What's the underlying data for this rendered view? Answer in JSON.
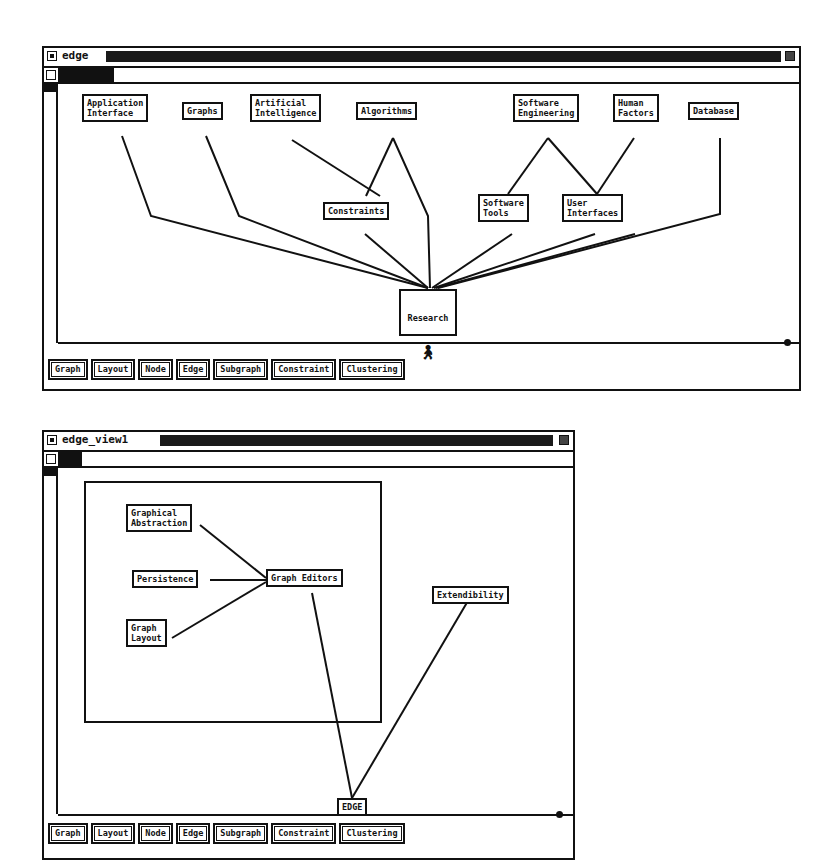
{
  "windows": [
    {
      "title": "edge",
      "nodes": [
        {
          "id": "app",
          "label": "Application\nInterface"
        },
        {
          "id": "graphs",
          "label": "Graphs"
        },
        {
          "id": "ai",
          "label": "Artificial\nIntelligence"
        },
        {
          "id": "algo",
          "label": "Algorithms"
        },
        {
          "id": "se",
          "label": "Software\nEngineering"
        },
        {
          "id": "hf",
          "label": "Human\nFactors"
        },
        {
          "id": "db",
          "label": "Database"
        },
        {
          "id": "constraints",
          "label": "Constraints"
        },
        {
          "id": "swtools",
          "label": "Software\nTools"
        },
        {
          "id": "ui",
          "label": "User\nInterfaces"
        },
        {
          "id": "research",
          "label": "Research",
          "icon": "person-icon"
        }
      ],
      "edges": [
        [
          "app",
          "research"
        ],
        [
          "graphs",
          "research"
        ],
        [
          "ai",
          "constraints"
        ],
        [
          "algo",
          "constraints"
        ],
        [
          "algo",
          "research"
        ],
        [
          "constraints",
          "research"
        ],
        [
          "se",
          "swtools"
        ],
        [
          "se",
          "ui"
        ],
        [
          "hf",
          "ui"
        ],
        [
          "swtools",
          "research"
        ],
        [
          "ui",
          "research"
        ],
        [
          "db",
          "research"
        ]
      ],
      "buttons": [
        "Graph",
        "Layout",
        "Node",
        "Edge",
        "Subgraph",
        "Constraint",
        "Clustering"
      ]
    },
    {
      "title": "edge_view1",
      "nodes": [
        {
          "id": "gabs",
          "label": "Graphical\nAbstraction"
        },
        {
          "id": "persist",
          "label": "Persistence"
        },
        {
          "id": "glayout",
          "label": "Graph\nLayout"
        },
        {
          "id": "geditors",
          "label": "Graph Editors"
        },
        {
          "id": "ext",
          "label": "Extendibility"
        },
        {
          "id": "edge",
          "label": "EDGE"
        }
      ],
      "edges": [
        [
          "gabs",
          "geditors"
        ],
        [
          "persist",
          "geditors"
        ],
        [
          "glayout",
          "geditors"
        ],
        [
          "geditors",
          "edge"
        ],
        [
          "ext",
          "edge"
        ]
      ],
      "buttons": [
        "Graph",
        "Layout",
        "Node",
        "Edge",
        "Subgraph",
        "Constraint",
        "Clustering"
      ]
    }
  ]
}
